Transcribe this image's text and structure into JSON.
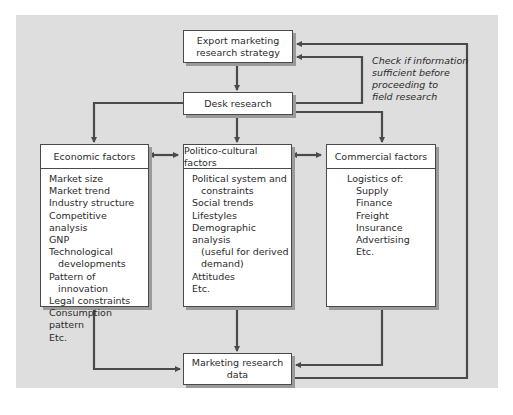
{
  "diagram": {
    "nodes": {
      "strategy": {
        "label_line1": "Export marketing",
        "label_line2": "research strategy"
      },
      "desk": {
        "label": "Desk research"
      },
      "economic": {
        "title": "Economic factors",
        "items": [
          {
            "text": "Market size",
            "indent": false
          },
          {
            "text": "Market trend",
            "indent": false
          },
          {
            "text": "Industry structure",
            "indent": false
          },
          {
            "text": "Competitive analysis",
            "indent": false
          },
          {
            "text": "GNP",
            "indent": false
          },
          {
            "text": "Technological",
            "indent": false
          },
          {
            "text": "developments",
            "indent": true
          },
          {
            "text": "Pattern of",
            "indent": false
          },
          {
            "text": "innovation",
            "indent": true
          },
          {
            "text": "Legal constraints",
            "indent": false
          },
          {
            "text": "Consumption pattern",
            "indent": false
          },
          {
            "text": "Etc.",
            "indent": false
          }
        ]
      },
      "politico": {
        "title": "Politico-cultural factors",
        "items": [
          {
            "text": "Political system and",
            "indent": false
          },
          {
            "text": "constraints",
            "indent": true
          },
          {
            "text": "Social trends",
            "indent": false
          },
          {
            "text": "Lifestyles",
            "indent": false
          },
          {
            "text": "Demographic analysis",
            "indent": false
          },
          {
            "text": "(useful for derived",
            "indent": true
          },
          {
            "text": "demand)",
            "indent": true
          },
          {
            "text": "Attitudes",
            "indent": false
          },
          {
            "text": "Etc.",
            "indent": false
          }
        ]
      },
      "commercial": {
        "title": "Commercial factors",
        "items": [
          {
            "text": "Logistics of:",
            "indent": false
          },
          {
            "text": "Supply",
            "indent": true
          },
          {
            "text": "Finance",
            "indent": true
          },
          {
            "text": "Freight",
            "indent": true
          },
          {
            "text": "Insurance",
            "indent": true
          },
          {
            "text": "Advertising",
            "indent": true
          },
          {
            "text": "Etc.",
            "indent": true
          }
        ]
      },
      "data": {
        "label_line1": "Marketing research",
        "label_line2": "data"
      }
    },
    "note": {
      "line1": "Check if information",
      "line2": "sufficient before",
      "line3": "proceeding to",
      "line4": "field research"
    },
    "colors": {
      "background": "#dedede",
      "box": "#ffffff",
      "line": "#4a4a4a",
      "shadow": "#9a9a9a"
    }
  }
}
